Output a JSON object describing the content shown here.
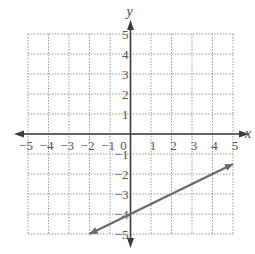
{
  "chart_data": {
    "type": "line",
    "title": "",
    "xlabel": "x",
    "ylabel": "y",
    "xlim": [
      -5,
      5
    ],
    "ylim": [
      -5,
      5
    ],
    "grid": true,
    "grid_style": "dotted",
    "x_ticks": [
      -5,
      -4,
      -3,
      -2,
      -1,
      0,
      1,
      2,
      3,
      4,
      5
    ],
    "y_ticks": [
      -5,
      -4,
      -3,
      -2,
      -1,
      1,
      2,
      3,
      4,
      5
    ],
    "x_tick_labels": [
      "−5",
      "−4",
      "−3",
      "−2",
      "−1",
      "0",
      "1",
      "2",
      "3",
      "4",
      "5"
    ],
    "y_tick_labels": [
      "−5",
      "−4",
      "−3",
      "−2",
      "−1",
      "1",
      "2",
      "3",
      "4",
      "5"
    ],
    "series": [
      {
        "name": "line",
        "equation": "y = 0.5x - 4",
        "x": [
          -2,
          5
        ],
        "y": [
          -5,
          -1.5
        ],
        "arrows": "both",
        "color": "#6b6b6b"
      }
    ],
    "legend": null
  },
  "colors": {
    "grid": "#9a9a9a",
    "axis": "#3a3a3a",
    "line": "#6b6b6b",
    "text": "#555555"
  }
}
